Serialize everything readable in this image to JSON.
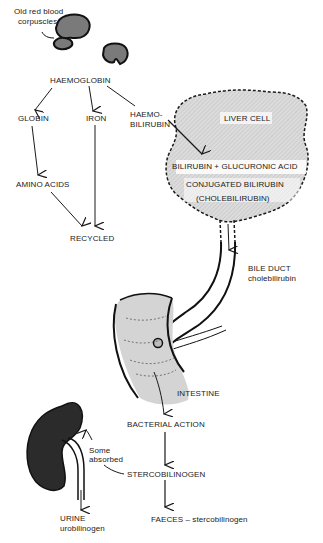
{
  "diagram": {
    "labels": {
      "rbc_line1": "Old red blood",
      "rbc_line2": "corpuscles",
      "haemoglobin": "HAEMOGLOBIN",
      "globin": "GLOBIN",
      "iron": "IRON",
      "haemo_bilirubin_line1": "HAEMO-",
      "haemo_bilirubin_line2": "BILIRUBIN",
      "amino_acids": "AMINO ACIDS",
      "recycled": "RECYCLED",
      "liver_cell": "LIVER CELL",
      "bilirubin_glucuronic": "BILIRUBIN + GLUCURONIC ACID",
      "conjugated_bilirubin": "CONJUGATED BILIRUBIN",
      "cholebilirubin": "(CHOLEBILIRUBIN)",
      "bile_duct": "BILE DUCT",
      "bile_duct_sub": "cholebilirubin",
      "intestine": "INTESTINE",
      "bacterial_action": "BACTERIAL ACTION",
      "some_absorbed_line1": "Some",
      "some_absorbed_line2": "absorbed",
      "stercobilinogen": "STERCOBILINOGEN",
      "urine": "URINE",
      "urine_sub": "urobilinogen",
      "faeces": "FAECES – stercobilinogen"
    },
    "colors": {
      "ink": "#1a1a1a",
      "liver_fill": "#d9d9d9",
      "intestine_fill": "#d4d4d4",
      "kidney_fill": "#2b2b2b",
      "rbc_fill": "#7a7a7a"
    }
  }
}
